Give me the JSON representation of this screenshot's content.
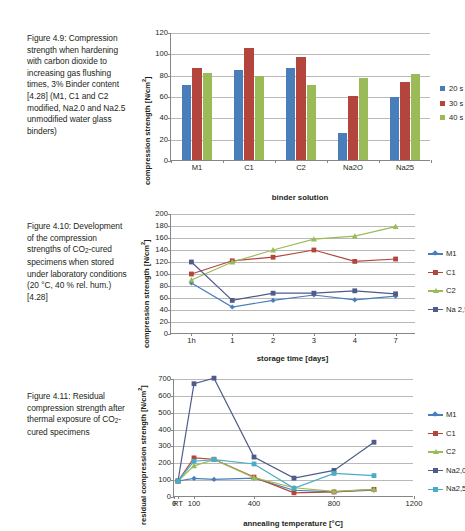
{
  "figures": [
    {
      "caption_id": "Figure 4.9:",
      "caption": "Figure 4.9: Compression strength when hardening with carbon dioxide to increasing gas flushing times, 3% Binder content [4.28] (M1, C1 and C2 modified, Na2.0 and Na2.5 unmodified water glass binders)",
      "chart_data": {
        "type": "bar",
        "title": "",
        "xlabel": "binder solution",
        "ylabel": "compression strength [N/cm²]",
        "ylim": [
          0,
          120
        ],
        "yticks": [
          0,
          20,
          40,
          60,
          80,
          100,
          120
        ],
        "grid": true,
        "legend_position": "right",
        "categories": [
          "M1",
          "C1",
          "C2",
          "Na2O",
          "Na25"
        ],
        "series": [
          {
            "name": "20 s",
            "color": "#4A7EBB",
            "values": [
              70,
              84,
              86,
              25,
              59
            ]
          },
          {
            "name": "30 s",
            "color": "#B4453C",
            "values": [
              86,
              105,
              97,
              60,
              73
            ]
          },
          {
            "name": "40 s",
            "color": "#9BBB59",
            "values": [
              82,
              79,
              70,
              77,
              81
            ]
          }
        ]
      }
    },
    {
      "caption_id": "Figure 4.10:",
      "caption": "Figure 4.10: Development of the compression strengths of CO2-cured specimens when stored under laboratory conditions (20 °C, 40 % rel. hum.) [4.28]",
      "chart_data": {
        "type": "line",
        "title": "",
        "xlabel": "storage time [days]",
        "ylabel": "compression strength [N/cm²]",
        "ylim": [
          0,
          200
        ],
        "yticks": [
          0,
          20,
          40,
          60,
          80,
          100,
          120,
          140,
          160,
          180,
          200
        ],
        "grid": true,
        "legend_position": "right",
        "x": [
          "1h",
          "1",
          "2",
          "3",
          "4",
          "7"
        ],
        "series": [
          {
            "name": "M1",
            "color": "#4A7EBB",
            "marker": "diamond",
            "values": [
              85,
              45,
              56,
              65,
              57,
              63
            ]
          },
          {
            "name": "C1",
            "color": "#B4453C",
            "marker": "square",
            "values": [
              100,
              122,
              128,
              140,
              121,
              125
            ]
          },
          {
            "name": "C2",
            "color": "#9BBB59",
            "marker": "triangle",
            "values": [
              90,
              120,
              140,
              158,
              163,
              179
            ]
          },
          {
            "name": "Na 2,5",
            "color": "#4F5B8B",
            "marker": "square",
            "values": [
              120,
              56,
              68,
              68,
              72,
              67
            ]
          }
        ]
      }
    },
    {
      "caption_id": "Figure 4.11:",
      "caption": "Figure 4.11: Residual compression strength after thermal exposure of CO2-cured specimens",
      "chart_data": {
        "type": "line",
        "title": "",
        "xlabel": "annealing temperature [°C]",
        "ylabel": "residual compression strength [N/cm²]",
        "ylim": [
          0,
          700
        ],
        "yticks": [
          0,
          100,
          200,
          300,
          400,
          500,
          600,
          700
        ],
        "grid": true,
        "legend_position": "right",
        "xticks": [
          "0",
          "RT",
          "100",
          "400",
          "800",
          "1200"
        ],
        "x": [
          "RT",
          "100",
          "200",
          "400",
          "600",
          "800",
          "1000"
        ],
        "series": [
          {
            "name": "M1",
            "color": "#4A7EBB",
            "marker": "diamond",
            "values": [
              95,
              110,
              104,
              112,
              40,
              30,
              40
            ]
          },
          {
            "name": "C1",
            "color": "#B4453C",
            "marker": "square",
            "values": [
              95,
              232,
              224,
              118,
              25,
              30,
              45
            ]
          },
          {
            "name": "C2",
            "color": "#9BBB59",
            "marker": "triangle",
            "values": [
              95,
              185,
              222,
              115,
              55,
              33,
              45
            ]
          },
          {
            "name": "Na2,0",
            "color": "#4F5B8B",
            "marker": "square",
            "values": [
              95,
              672,
              705,
              237,
              112,
              158,
              325
            ]
          },
          {
            "name": "Na2,5",
            "color": "#4BACC6",
            "marker": "square",
            "values": [
              95,
              212,
              222,
              196,
              52,
              140,
              127
            ]
          }
        ]
      }
    }
  ]
}
